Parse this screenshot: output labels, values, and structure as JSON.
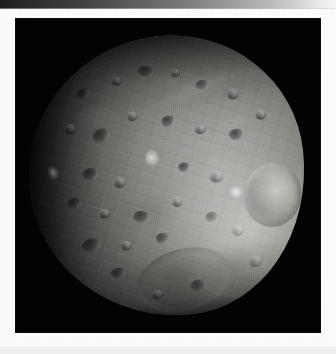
{
  "page": {
    "background_color": "#fcfcfc",
    "top_band": {
      "name": "scan-edge-gradient",
      "from_color": "#1d1d1d",
      "to_color": "#f5f5f5"
    }
  },
  "photo": {
    "alt_text": "Phobos, the larger moon of Mars, photographed against black space",
    "subject": "Phobos",
    "background_color": "#000000",
    "frame": {
      "left": 15,
      "top": 18,
      "width": 306,
      "height": 315
    },
    "features": [
      {
        "name": "stickney-crater",
        "label": "Stickney"
      },
      {
        "name": "terminator",
        "label": "Terminator"
      },
      {
        "name": "south-basin",
        "label": "Basin"
      },
      {
        "name": "limb-highlight",
        "label": "Limb highlight"
      }
    ],
    "colors": {
      "regolith_light": "#a9a9a6",
      "regolith_mid": "#6d6d68",
      "regolith_dark": "#1c1c1e",
      "space": "#030303"
    }
  }
}
